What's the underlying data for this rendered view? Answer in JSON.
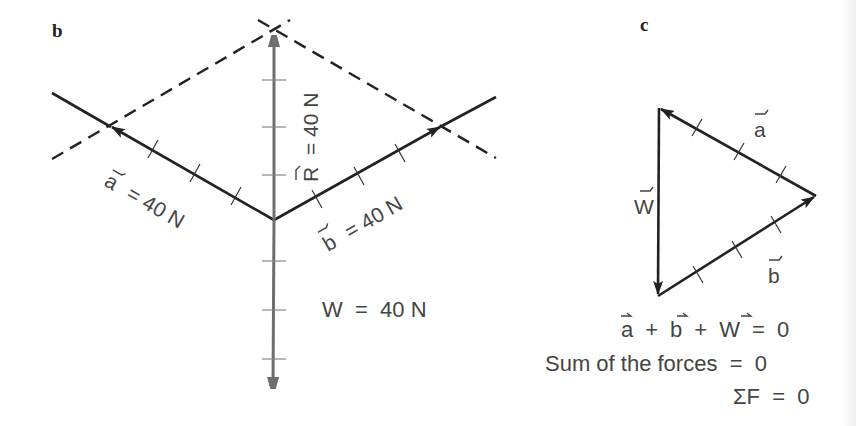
{
  "panels": {
    "b": {
      "label": "b",
      "vector_a_label": "a",
      "vector_a_eq": "= 40 N",
      "vector_b_label": "b",
      "vector_b_eq": "= 40 N",
      "resultant_label": "R",
      "resultant_eq": "= 40 N",
      "weight_eq": "W  =  40 N"
    },
    "c": {
      "label": "c",
      "side_a": "a",
      "side_b": "b",
      "side_w": "W",
      "equations": [
        "a + b + W = 0",
        "Sum of the forces  =  0",
        "ΣF  =  0"
      ],
      "eq1_parts": {
        "a": "a",
        "plus1": "+",
        "b": "b",
        "plus2": "+",
        "w": "W",
        "eq": "=  0"
      }
    }
  },
  "colors": {
    "ink": "#222222",
    "gray_vector": "#707070",
    "text": "#444444"
  }
}
